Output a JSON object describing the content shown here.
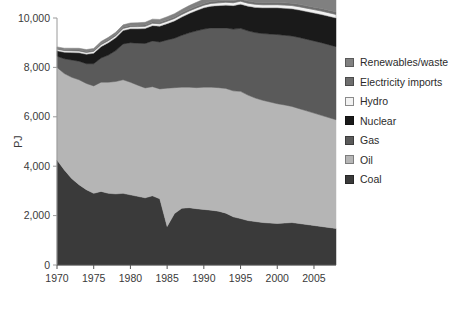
{
  "chart_data": {
    "type": "area",
    "title": "",
    "xlabel": "",
    "ylabel": "PJ",
    "stacked": true,
    "xlim": [
      1970,
      2008
    ],
    "ylim": [
      0,
      10000
    ],
    "ytick_step": 2000,
    "xtick_step": 5,
    "grid": false,
    "legend_position": "right",
    "ytick_labels": [
      "0",
      "2,000",
      "4,000",
      "6,000",
      "8,000",
      "10,000"
    ],
    "ytick_values": [
      0,
      2000,
      4000,
      6000,
      8000,
      10000
    ],
    "xtick_labels": [
      "1970",
      "1975",
      "1980",
      "1985",
      "1990",
      "1995",
      "2000",
      "2005"
    ],
    "xtick_values": [
      1970,
      1975,
      1980,
      1985,
      1990,
      1995,
      2000,
      2005
    ],
    "x": [
      1970,
      1971,
      1972,
      1973,
      1974,
      1975,
      1976,
      1977,
      1978,
      1979,
      1980,
      1981,
      1982,
      1983,
      1984,
      1985,
      1986,
      1987,
      1988,
      1989,
      1990,
      1991,
      1992,
      1993,
      1994,
      1995,
      1996,
      1997,
      1998,
      1999,
      2000,
      2001,
      2002,
      2003,
      2004,
      2005,
      2006,
      2007,
      2008
    ],
    "stack_order_bottom_to_top": [
      "Coal",
      "Oil",
      "Gas",
      "Nuclear",
      "Hydro",
      "Electricity imports",
      "Renewables/waste"
    ],
    "series": [
      {
        "name": "Coal",
        "color": "#3a3a3a",
        "values": [
          4250,
          3850,
          3500,
          3250,
          3050,
          2900,
          2980,
          2900,
          2880,
          2900,
          2840,
          2780,
          2720,
          2800,
          2680,
          1560,
          2080,
          2300,
          2320,
          2280,
          2250,
          2220,
          2180,
          2100,
          1950,
          1880,
          1800,
          1760,
          1720,
          1700,
          1680,
          1700,
          1720,
          1680,
          1640,
          1600,
          1560,
          1520,
          1480
        ]
      },
      {
        "name": "Oil",
        "color": "#b5b5b5",
        "values": [
          3750,
          3900,
          4100,
          4250,
          4300,
          4350,
          4420,
          4500,
          4550,
          4600,
          4560,
          4500,
          4450,
          4420,
          4450,
          5600,
          5100,
          4900,
          4880,
          4900,
          4950,
          4980,
          5000,
          5050,
          5100,
          5150,
          5080,
          5000,
          4950,
          4900,
          4850,
          4780,
          4700,
          4650,
          4600,
          4550,
          4500,
          4450,
          4400
        ]
      },
      {
        "name": "Gas",
        "color": "#5a5a5a",
        "values": [
          450,
          600,
          700,
          750,
          800,
          900,
          980,
          1100,
          1250,
          1450,
          1600,
          1700,
          1800,
          1850,
          1900,
          1950,
          2000,
          2100,
          2200,
          2300,
          2350,
          2400,
          2420,
          2450,
          2500,
          2550,
          2600,
          2650,
          2700,
          2750,
          2800,
          2820,
          2850,
          2880,
          2900,
          2920,
          2940,
          2950,
          2960
        ]
      },
      {
        "name": "Nuclear",
        "color": "#1a1a1a",
        "values": [
          220,
          260,
          300,
          340,
          380,
          420,
          460,
          500,
          520,
          540,
          560,
          580,
          600,
          620,
          640,
          660,
          700,
          740,
          780,
          820,
          860,
          880,
          900,
          920,
          950,
          980,
          1000,
          1020,
          1040,
          1060,
          1080,
          1090,
          1100,
          1110,
          1120,
          1130,
          1140,
          1150,
          1160
        ]
      },
      {
        "name": "Hydro",
        "color": "#f2f2f2",
        "values": [
          70,
          72,
          74,
          76,
          78,
          80,
          82,
          84,
          86,
          88,
          90,
          92,
          94,
          96,
          98,
          100,
          102,
          104,
          106,
          108,
          110,
          112,
          114,
          116,
          118,
          120,
          122,
          124,
          126,
          128,
          130,
          132,
          134,
          136,
          138,
          140,
          142,
          144,
          146
        ]
      },
      {
        "name": "Electricity imports",
        "color": "#6e6e6e",
        "values": [
          30,
          32,
          34,
          36,
          38,
          40,
          42,
          44,
          46,
          48,
          50,
          52,
          54,
          56,
          58,
          60,
          62,
          64,
          66,
          68,
          70,
          72,
          74,
          76,
          78,
          80,
          82,
          84,
          86,
          88,
          90,
          92,
          94,
          96,
          98,
          100,
          102,
          104,
          106
        ]
      },
      {
        "name": "Renewables/waste",
        "color": "#808080",
        "values": [
          60,
          64,
          68,
          72,
          76,
          80,
          84,
          88,
          92,
          96,
          100,
          104,
          108,
          112,
          116,
          120,
          130,
          140,
          150,
          160,
          175,
          190,
          205,
          220,
          240,
          260,
          280,
          300,
          320,
          340,
          360,
          380,
          400,
          420,
          440,
          460,
          480,
          500,
          520
        ]
      }
    ],
    "legend_entries": [
      {
        "label": "Renewables/waste",
        "color": "#808080",
        "border": "#5a5a5a"
      },
      {
        "label": "Electricity imports",
        "color": "#6e6e6e",
        "border": "#4a4a4a"
      },
      {
        "label": "Hydro",
        "color": "#f2f2f2",
        "border": "#8a8a8a"
      },
      {
        "label": "Nuclear",
        "color": "#1a1a1a",
        "border": "#111111"
      },
      {
        "label": "Gas",
        "color": "#5a5a5a",
        "border": "#3d3d3d"
      },
      {
        "label": "Oil",
        "color": "#b5b5b5",
        "border": "#7d7d7d"
      },
      {
        "label": "Coal",
        "color": "#3a3a3a",
        "border": "#262626"
      }
    ]
  }
}
